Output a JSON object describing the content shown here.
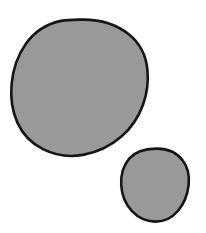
{
  "image": {
    "kind": "line-drawing",
    "description": "Two hand-drawn filled circles on a plain white background",
    "width": 206,
    "height": 233,
    "background_color": "#ffffff"
  },
  "palette": {
    "fill_gray": "#999999",
    "outline_black": "#161616",
    "background_white": "#ffffff"
  },
  "shapes": [
    {
      "name": "large-circle",
      "label": "Large circle",
      "fill": "#999999",
      "stroke": "#161616",
      "stroke_width": 2.6,
      "bounds": {
        "x": 15,
        "y": 19,
        "width": 133,
        "height": 138
      },
      "center": {
        "x": 81,
        "y": 88
      },
      "radius_x": 66,
      "radius_y": 69,
      "path": "M 81.5 19.6 C 99.5 19.2 116.0 24.2 128.5 34.0 C 139.6 42.8 146.0 55.4 147.4 69.6 C 148.6 81.8 147.0 93.6 143.0 104.8 C 138.6 117.0 131.4 128.0 121.4 136.6 C 110.6 146.0 97.4 152.4 83.0 154.9 C 69.0 157.3 55.2 155.4 43.0 149.2 C 31.6 143.4 22.6 134.2 17.4 122.6 C 12.0 110.6 10.4 97.2 11.6 84.0 C 12.9 69.6 17.4 55.8 25.6 44.2 C 34.2 32.0 46.6 23.8 61.2 20.9 C 67.9 19.6 74.7 19.7 81.5 19.6 Z"
    },
    {
      "name": "small-circle",
      "label": "Small circle",
      "fill": "#999999",
      "stroke": "#161616",
      "stroke_width": 2.6,
      "bounds": {
        "x": 121,
        "y": 148,
        "width": 68,
        "height": 74
      },
      "center": {
        "x": 155,
        "y": 185
      },
      "radius_x": 34,
      "radius_y": 37,
      "path": "M 156.0 148.6 C 166.6 148.4 176.4 152.2 182.6 160.2 C 188.0 167.2 189.6 176.2 188.6 185.0 C 187.6 194.6 184.0 203.8 177.8 211.0 C 172.0 217.8 163.8 221.8 155.0 221.6 C 146.2 221.4 138.0 217.6 132.0 211.2 C 125.4 204.2 121.8 194.8 121.2 185.2 C 120.6 175.6 123.2 165.8 129.4 158.4 C 135.4 151.4 145.6 148.8 156.0 148.6 Z"
    }
  ]
}
